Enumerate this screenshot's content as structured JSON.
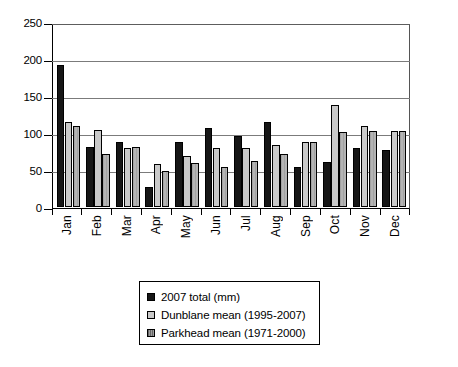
{
  "chart_data": {
    "type": "bar",
    "title": "",
    "subtitle": "",
    "xlabel": "",
    "ylabel": "",
    "ylim": [
      0,
      250
    ],
    "yticks": [
      0,
      50,
      100,
      150,
      200,
      250
    ],
    "grid": true,
    "legend_position": "bottom",
    "categories": [
      "Jan",
      "Feb",
      "Mar",
      "Apr",
      "May",
      "Jun",
      "Jul",
      "Aug",
      "Sep",
      "Oct",
      "Nov",
      "Dec"
    ],
    "series": [
      {
        "name": "2007 total (mm)",
        "color": "#161616",
        "values": [
          193,
          82,
          88,
          27,
          89,
          107,
          96,
          115,
          55,
          62,
          80,
          77
        ]
      },
      {
        "name": "Dunblane mean (1995-2007)",
        "color": "#c9c9c9",
        "values": [
          115,
          105,
          80,
          59,
          70,
          80,
          80,
          85,
          88,
          138,
          110,
          103
        ]
      },
      {
        "name": "Parkhead mean (1971-2000)",
        "color": "#b4b4b4",
        "values": [
          110,
          72,
          82,
          49,
          60,
          54,
          63,
          72,
          88,
          102,
          103,
          103
        ]
      }
    ]
  },
  "legend": {
    "items": [
      {
        "label": "2007 total (mm)",
        "swatch": "black-square-icon"
      },
      {
        "label": "Dunblane mean (1995-2007)",
        "swatch": "light-grey-square-icon"
      },
      {
        "label": "Parkhead mean (1971-2000)",
        "swatch": "hatched-grey-square-icon"
      }
    ]
  },
  "axes": {
    "y_tick_labels": [
      "250",
      "200",
      "150",
      "100",
      "50",
      "0"
    ],
    "x_tick_labels": [
      "Jan",
      "Feb",
      "Mar",
      "Apr",
      "May",
      "Jun",
      "Jul",
      "Aug",
      "Sep",
      "Oct",
      "Nov",
      "Dec"
    ]
  }
}
